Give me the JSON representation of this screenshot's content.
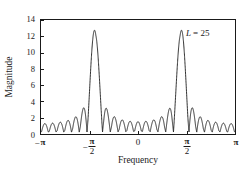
{
  "chart_data": {
    "type": "line",
    "title": "",
    "subtitle": "",
    "xlabel": "Frequency",
    "ylabel": "Magnitude",
    "xlim": [
      -3.14159265,
      3.14159265
    ],
    "ylim": [
      0,
      14
    ],
    "grid": false,
    "legend": null,
    "annotations": [
      {
        "text_symbol": "L",
        "text_equals": "=",
        "text_value": "25",
        "full_text": "L = 25",
        "x": 2.1,
        "y": 11.2
      }
    ],
    "x_ticks": [
      {
        "value": -3.14159265,
        "label": "-π",
        "sign": "−",
        "pi": "π",
        "kind": "plain"
      },
      {
        "value": -1.57079633,
        "label": "-π/2",
        "sign": "−",
        "num": "π",
        "den": "2",
        "kind": "fraction"
      },
      {
        "value": 0,
        "label": "0",
        "kind": "plain_number"
      },
      {
        "value": 1.57079633,
        "label": "π/2",
        "sign": "",
        "num": "π",
        "den": "2",
        "kind": "fraction"
      },
      {
        "value": 3.14159265,
        "label": "π",
        "sign": "",
        "pi": "π",
        "kind": "plain"
      }
    ],
    "y_ticks": [
      {
        "value": 0,
        "label": "0"
      },
      {
        "value": 2,
        "label": "2"
      },
      {
        "value": 4,
        "label": "4"
      },
      {
        "value": 6,
        "label": "6"
      },
      {
        "value": 8,
        "label": "8"
      },
      {
        "value": 10,
        "label": "10"
      },
      {
        "value": 12,
        "label": "12"
      },
      {
        "value": 14,
        "label": "14"
      }
    ],
    "series": [
      {
        "name": "magnitude",
        "color": "#1a1a1a",
        "line_width": 1,
        "L": 25,
        "peaks": [
          {
            "x": -1.4,
            "y": 12.5
          },
          {
            "x": 1.4,
            "y": 12.5
          }
        ],
        "sidelobe_max": 2.9,
        "sidelobe_min": 0.0
      }
    ]
  },
  "figure": {
    "background_color": "#ffffff",
    "axis_color": "#1a1a1a",
    "curve_color": "#1a1a1a"
  }
}
